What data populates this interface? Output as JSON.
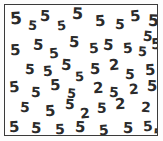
{
  "stimulus": {
    "name": "visual-search-array",
    "description": "Visual search display: field of distractor digits with embedded target digits",
    "target_symbol": "2",
    "distractor_symbol": "5",
    "target_count": 10,
    "distractor_count": 53,
    "total_items": 63,
    "colors": {
      "page_background": "#ffffff",
      "field_background": "#ffffff",
      "border": "#3b3b3b",
      "glyph": "#2b2b2b"
    },
    "border_width_px": 1,
    "items": [
      {
        "char": "5",
        "x": 5,
        "y": 5,
        "size": 17,
        "rot": -4
      },
      {
        "char": "5",
        "x": 23,
        "y": 14,
        "size": 13,
        "rot": 5
      },
      {
        "char": "5",
        "x": 35,
        "y": 4,
        "size": 15,
        "rot": 2
      },
      {
        "char": "5",
        "x": 52,
        "y": 14,
        "size": 13,
        "rot": -6
      },
      {
        "char": "5",
        "x": 67,
        "y": 1,
        "size": 16,
        "rot": 3
      },
      {
        "char": "5",
        "x": 90,
        "y": 9,
        "size": 15,
        "rot": -3
      },
      {
        "char": "5",
        "x": 110,
        "y": 12,
        "size": 14,
        "rot": 4
      },
      {
        "char": "5",
        "x": 125,
        "y": 4,
        "size": 15,
        "rot": -5
      },
      {
        "char": "5",
        "x": 143,
        "y": 8,
        "size": 16,
        "rot": 2
      },
      {
        "char": "5",
        "x": 138,
        "y": 24,
        "size": 14,
        "rot": 6
      },
      {
        "char": "5",
        "x": 5,
        "y": 38,
        "size": 15,
        "rot": -2
      },
      {
        "char": "5",
        "x": 28,
        "y": 33,
        "size": 15,
        "rot": 4
      },
      {
        "char": "5",
        "x": 44,
        "y": 41,
        "size": 14,
        "rot": -5
      },
      {
        "char": "5",
        "x": 64,
        "y": 30,
        "size": 15,
        "rot": 3
      },
      {
        "char": "5",
        "x": 84,
        "y": 36,
        "size": 14,
        "rot": -3
      },
      {
        "char": "5",
        "x": 98,
        "y": 33,
        "size": 15,
        "rot": 5
      },
      {
        "char": "5",
        "x": 118,
        "y": 36,
        "size": 14,
        "rot": -4
      },
      {
        "char": "5",
        "x": 133,
        "y": 40,
        "size": 13,
        "rot": 3
      },
      {
        "char": "5",
        "x": 146,
        "y": 32,
        "size": 15,
        "rot": -2
      },
      {
        "char": "5",
        "x": 20,
        "y": 57,
        "size": 14,
        "rot": 3
      },
      {
        "char": "5",
        "x": 38,
        "y": 59,
        "size": 14,
        "rot": -4
      },
      {
        "char": "5",
        "x": 56,
        "y": 53,
        "size": 15,
        "rot": 5
      },
      {
        "char": "5",
        "x": 70,
        "y": 65,
        "size": 13,
        "rot": -3
      },
      {
        "char": "5",
        "x": 85,
        "y": 57,
        "size": 15,
        "rot": 2
      },
      {
        "char": "2",
        "x": 104,
        "y": 53,
        "size": 15,
        "rot": -4
      },
      {
        "char": "5",
        "x": 120,
        "y": 62,
        "size": 14,
        "rot": 4
      },
      {
        "char": "5",
        "x": 140,
        "y": 58,
        "size": 15,
        "rot": -3
      },
      {
        "char": "5",
        "x": 4,
        "y": 75,
        "size": 15,
        "rot": -5
      },
      {
        "char": "5",
        "x": 26,
        "y": 80,
        "size": 14,
        "rot": 3
      },
      {
        "char": "5",
        "x": 45,
        "y": 73,
        "size": 15,
        "rot": -2
      },
      {
        "char": "5",
        "x": 62,
        "y": 82,
        "size": 13,
        "rot": 5
      },
      {
        "char": "2",
        "x": 88,
        "y": 76,
        "size": 15,
        "rot": -3
      },
      {
        "char": "5",
        "x": 104,
        "y": 80,
        "size": 14,
        "rot": 4
      },
      {
        "char": "2",
        "x": 124,
        "y": 77,
        "size": 14,
        "rot": -4
      },
      {
        "char": "5",
        "x": 142,
        "y": 74,
        "size": 15,
        "rot": 2
      },
      {
        "char": "5",
        "x": 15,
        "y": 95,
        "size": 14,
        "rot": 4
      },
      {
        "char": "5",
        "x": 40,
        "y": 99,
        "size": 15,
        "rot": -3
      },
      {
        "char": "5",
        "x": 60,
        "y": 92,
        "size": 14,
        "rot": 3
      },
      {
        "char": "2",
        "x": 75,
        "y": 101,
        "size": 14,
        "rot": -5
      },
      {
        "char": "5",
        "x": 92,
        "y": 96,
        "size": 14,
        "rot": 2
      },
      {
        "char": "2",
        "x": 110,
        "y": 92,
        "size": 15,
        "rot": -3
      },
      {
        "char": "2",
        "x": 136,
        "y": 95,
        "size": 14,
        "rot": 4
      },
      {
        "char": "5",
        "x": 4,
        "y": 115,
        "size": 15,
        "rot": -3
      },
      {
        "char": "5",
        "x": 26,
        "y": 116,
        "size": 15,
        "rot": 4
      },
      {
        "char": "5",
        "x": 50,
        "y": 117,
        "size": 14,
        "rot": -2
      },
      {
        "char": "5",
        "x": 70,
        "y": 115,
        "size": 15,
        "rot": 3
      },
      {
        "char": "5",
        "x": 94,
        "y": 118,
        "size": 14,
        "rot": -4
      },
      {
        "char": "5",
        "x": 118,
        "y": 116,
        "size": 15,
        "rot": 2
      },
      {
        "char": "5",
        "x": 138,
        "y": 114,
        "size": 14,
        "rot": -3
      },
      {
        "char": "5",
        "x": 148,
        "y": 122,
        "size": 13,
        "rot": 5
      }
    ]
  }
}
